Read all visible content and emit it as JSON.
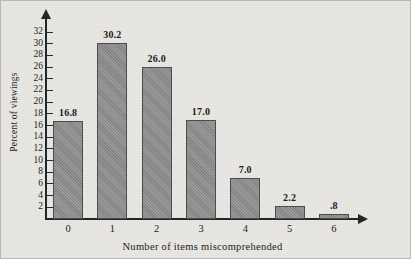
{
  "chart_data": {
    "type": "bar",
    "title": "",
    "subtitle": "",
    "xlabel": "Number of items miscomprehended",
    "ylabel": "Percent of viewings",
    "categories": [
      "0",
      "1",
      "2",
      "3",
      "4",
      "5",
      "6"
    ],
    "values": [
      16.8,
      30.2,
      26.0,
      17.0,
      7.0,
      2.2,
      0.8
    ],
    "value_labels": [
      "16.8",
      "30.2",
      "26.0",
      "17.0",
      "7.0",
      "2.2",
      ".8"
    ],
    "ylim": [
      0,
      32
    ],
    "xlim": [
      0,
      7
    ],
    "y_ticks": [
      2,
      4,
      6,
      8,
      10,
      12,
      14,
      16,
      18,
      20,
      22,
      24,
      26,
      28,
      30,
      32
    ],
    "y_tick_labels": [
      "2",
      "4",
      "6",
      "8",
      "10",
      "12",
      "14",
      "16",
      "18",
      "20",
      "22",
      "24",
      "26",
      "28",
      "30",
      "32"
    ],
    "grid": false,
    "legend": null,
    "legend_position": "none",
    "annotations": [],
    "series": [
      {
        "name": "Percent of viewings",
        "values": [
          16.8,
          30.2,
          26.0,
          17.0,
          7.0,
          2.2,
          0.8
        ]
      }
    ]
  },
  "style": {
    "background_color": "#e9e8e5",
    "bar_fill_color": "#8c8c8c",
    "bar_edge_color": "#4c4c4c",
    "axis_color": "#242424",
    "text_color": "#1a1a1a"
  },
  "axes": {
    "y_axis_arrow": "arrow-up-icon",
    "x_axis_arrow": "arrow-right-icon"
  }
}
